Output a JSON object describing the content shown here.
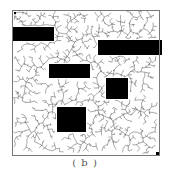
{
  "figure": {
    "caption": "( b )",
    "frame": {
      "x": 12,
      "y": 10,
      "w": 147,
      "h": 145,
      "stroke": "#777777"
    },
    "obstacles": [
      {
        "x": 12,
        "y": 27,
        "w": 42,
        "h": 14
      },
      {
        "x": 98,
        "y": 40,
        "w": 64,
        "h": 15
      },
      {
        "x": 49,
        "y": 64,
        "w": 41,
        "h": 14
      },
      {
        "x": 106,
        "y": 78,
        "w": 22,
        "h": 21
      },
      {
        "x": 57,
        "y": 107,
        "w": 29,
        "h": 25
      }
    ],
    "start_marker": {
      "x": 14,
      "y": 12
    },
    "goal_marker": {
      "x": 156,
      "y": 152
    },
    "tree": {
      "color": "#555555",
      "node_count": 1400,
      "step": 4,
      "seed": 7
    },
    "colors": {
      "obstacle": "#000000",
      "background": "#ffffff"
    }
  }
}
